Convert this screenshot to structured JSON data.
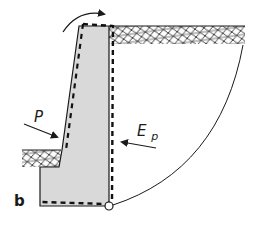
{
  "figure": {
    "panel_label": "b",
    "labels": {
      "active_force": "P",
      "passive_force_main": "E",
      "passive_force_sub": "p"
    },
    "colors": {
      "wall_fill": "#d9d9d9",
      "stroke": "#1a1a1a",
      "background": "#ffffff"
    },
    "elements": [
      "retaining-wall",
      "displaced-wall-outline",
      "backfill-soil",
      "toe-soil",
      "rotation-arrow",
      "hinge-point",
      "slip-circle-arc",
      "active-force-arrow",
      "passive-force-arrow"
    ]
  }
}
